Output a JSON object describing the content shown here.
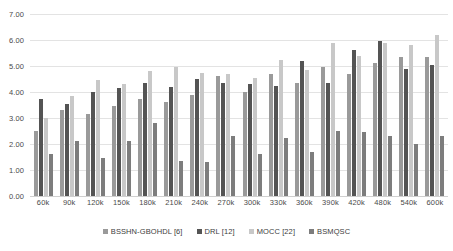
{
  "chart_data": {
    "type": "bar",
    "title": "",
    "xlabel": "",
    "ylabel": "",
    "ylim": [
      0.0,
      7.0
    ],
    "ytick_step": 1.0,
    "yticks": [
      "7.00",
      "6.00",
      "5.00",
      "4.00",
      "3.00",
      "2.00",
      "1.00",
      "0.00"
    ],
    "ytick_values": [
      7.0,
      6.0,
      5.0,
      4.0,
      3.0,
      2.0,
      1.0,
      0.0
    ],
    "grid": true,
    "legend_position": "bottom",
    "categories": [
      "60k",
      "90k",
      "120k",
      "150k",
      "180k",
      "210k",
      "240k",
      "270k",
      "300k",
      "330k",
      "360k",
      "390k",
      "420k",
      "480k",
      "540k",
      "600k"
    ],
    "series": [
      {
        "name": "BSSHN-GBOHDL [6]",
        "color": "#9a9a9a",
        "values": [
          2.5,
          3.3,
          3.15,
          3.45,
          3.75,
          3.6,
          3.9,
          4.6,
          4.0,
          4.7,
          4.35,
          4.95,
          4.7,
          5.1,
          5.35,
          5.35
        ]
      },
      {
        "name": "DRL [12]",
        "color": "#545454",
        "values": [
          3.75,
          3.55,
          4.0,
          4.15,
          4.35,
          4.2,
          4.5,
          4.35,
          4.3,
          4.25,
          5.2,
          4.35,
          5.6,
          5.95,
          4.9,
          5.05
        ]
      },
      {
        "name": "MOCC [22]",
        "color": "#c8c8c8",
        "values": [
          3.0,
          3.85,
          4.45,
          4.3,
          4.8,
          4.95,
          4.75,
          4.7,
          4.55,
          5.25,
          4.85,
          5.9,
          5.4,
          5.9,
          5.8,
          6.2
        ]
      },
      {
        "name": "BSMQSC",
        "color": "#7d7d7d",
        "values": [
          1.6,
          2.1,
          1.45,
          2.1,
          2.8,
          1.35,
          1.3,
          2.3,
          1.6,
          2.25,
          1.7,
          2.5,
          2.45,
          2.3,
          2.0,
          2.3
        ]
      }
    ]
  },
  "legend": {
    "items": [
      {
        "label": "BSSHN-GBOHDL [6]",
        "color": "#9a9a9a"
      },
      {
        "label": "DRL [12]",
        "color": "#545454"
      },
      {
        "label": "MOCC [22]",
        "color": "#c8c8c8"
      },
      {
        "label": "BSMQSC",
        "color": "#7d7d7d"
      }
    ]
  }
}
